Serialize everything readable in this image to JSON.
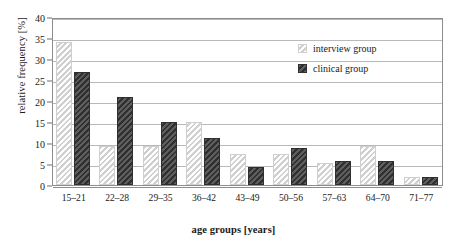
{
  "chart_data": {
    "type": "bar",
    "title": "",
    "xlabel": "age groups [years]",
    "ylabel": "relative frequency [%]",
    "categories": [
      "15–21",
      "22–28",
      "29–35",
      "36–42",
      "43–49",
      "50–56",
      "57–63",
      "64–70",
      "71–77"
    ],
    "series": [
      {
        "name": "interview group",
        "color": "#e8e8e8",
        "values": [
          34.0,
          9.3,
          9.3,
          15.0,
          7.3,
          7.3,
          5.3,
          9.3,
          2.0
        ]
      },
      {
        "name": "clinical group",
        "color": "#434343",
        "values": [
          27.0,
          21.0,
          15.0,
          11.2,
          4.4,
          8.7,
          5.7,
          5.7,
          2.0
        ]
      }
    ],
    "ylim": [
      0,
      40
    ],
    "ytick_step": 5,
    "yticks": [
      "0",
      "5",
      "10",
      "15",
      "20",
      "25",
      "30",
      "35",
      "40"
    ],
    "grid": "horizontal",
    "legend_position": "top-right-inside"
  }
}
